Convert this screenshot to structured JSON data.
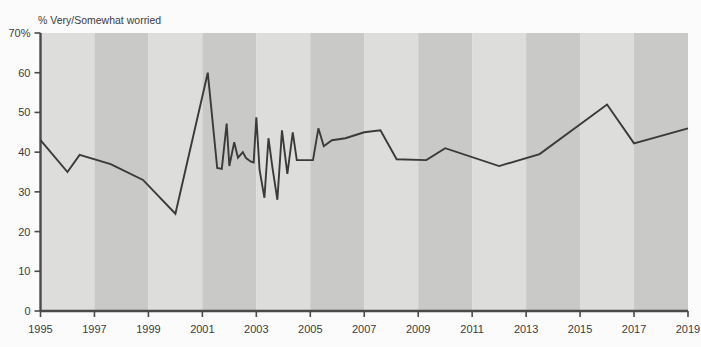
{
  "chart_data": {
    "type": "line",
    "title": "",
    "ylabel": "% Very/Somewhat worried",
    "xlabel": "",
    "ylim": [
      0,
      70
    ],
    "xlim": [
      1995,
      2019
    ],
    "grid": false,
    "legend": null,
    "y_ticks": [
      {
        "value": 0,
        "label": "0"
      },
      {
        "value": 10,
        "label": "10"
      },
      {
        "value": 20,
        "label": "20"
      },
      {
        "value": 30,
        "label": "30"
      },
      {
        "value": 40,
        "label": "40"
      },
      {
        "value": 50,
        "label": "50"
      },
      {
        "value": 60,
        "label": "60"
      },
      {
        "value": 70,
        "label": "70%"
      }
    ],
    "x_ticks": [
      {
        "value": 1995,
        "label": "1995"
      },
      {
        "value": 1997,
        "label": "1997"
      },
      {
        "value": 1999,
        "label": "1999"
      },
      {
        "value": 2001,
        "label": "2001"
      },
      {
        "value": 2003,
        "label": "2003"
      },
      {
        "value": 2005,
        "label": "2005"
      },
      {
        "value": 2007,
        "label": "2007"
      },
      {
        "value": 2009,
        "label": "2009"
      },
      {
        "value": 2011,
        "label": "2011"
      },
      {
        "value": 2013,
        "label": "2013"
      },
      {
        "value": 2015,
        "label": "2015"
      },
      {
        "value": 2017,
        "label": "2017"
      },
      {
        "value": 2019,
        "label": "2019"
      }
    ],
    "band_colors": [
      "#dddddb",
      "#c9c9c7"
    ],
    "band_width_years": 2,
    "line_color": "#3a3a3a",
    "series": [
      {
        "name": "% Very/Somewhat worried",
        "points": [
          [
            1995.0,
            43.0
          ],
          [
            1996.0,
            35.0
          ],
          [
            1996.45,
            39.3
          ],
          [
            1997.6,
            37.0
          ],
          [
            1998.8,
            33.0
          ],
          [
            2000.0,
            24.5
          ],
          [
            2001.2,
            60.0
          ],
          [
            2001.55,
            36.0
          ],
          [
            2001.72,
            35.8
          ],
          [
            2001.9,
            47.2
          ],
          [
            2002.0,
            36.5
          ],
          [
            2002.18,
            42.5
          ],
          [
            2002.32,
            38.6
          ],
          [
            2002.5,
            40.0
          ],
          [
            2002.62,
            38.5
          ],
          [
            2002.8,
            37.6
          ],
          [
            2002.9,
            37.4
          ],
          [
            2003.0,
            48.8
          ],
          [
            2003.12,
            35.5
          ],
          [
            2003.3,
            28.5
          ],
          [
            2003.45,
            43.5
          ],
          [
            2003.6,
            36.0
          ],
          [
            2003.78,
            28.0
          ],
          [
            2003.95,
            45.5
          ],
          [
            2004.15,
            34.5
          ],
          [
            2004.35,
            45.0
          ],
          [
            2004.5,
            38.0
          ],
          [
            2005.1,
            38.0
          ],
          [
            2005.3,
            46.0
          ],
          [
            2005.5,
            41.5
          ],
          [
            2005.8,
            43.0
          ],
          [
            2006.3,
            43.5
          ],
          [
            2007.0,
            45.0
          ],
          [
            2007.6,
            45.5
          ],
          [
            2008.2,
            38.2
          ],
          [
            2009.3,
            38.0
          ],
          [
            2010.0,
            41.0
          ],
          [
            2012.0,
            36.5
          ],
          [
            2013.5,
            39.5
          ],
          [
            2016.0,
            52.0
          ],
          [
            2017.0,
            42.2
          ],
          [
            2019.0,
            46.0
          ]
        ]
      }
    ]
  }
}
